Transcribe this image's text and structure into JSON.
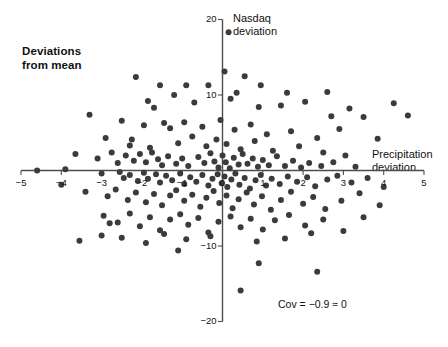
{
  "figure": {
    "title": "Deviations\nfrom mean",
    "width": 448,
    "height": 347,
    "background": "#ffffff",
    "point_color": "#3b3b3b",
    "axis_color": "#4d4d4d"
  },
  "annotations": {
    "covariance": "Cov = −0.9 ≈ 0"
  },
  "chart_data": {
    "type": "scatter",
    "title": "Deviations from mean",
    "xlabel": "Precipitation\ndeviation",
    "ylabel": "Nasdaq\ndeviation",
    "xlim": [
      -5,
      5
    ],
    "ylim": [
      -20,
      20
    ],
    "xticks": [
      -5,
      -4,
      -3,
      -2,
      -1,
      0,
      1,
      2,
      3,
      4,
      5
    ],
    "xticklabels": [
      "−5",
      "−4",
      "−3",
      "−2",
      "−1",
      "0",
      "1",
      "2",
      "3",
      "4",
      "5"
    ],
    "yticks": [
      -20,
      -10,
      0,
      10,
      20
    ],
    "yticklabels": [
      "−20",
      "−10",
      "0",
      "10",
      "20"
    ],
    "grid": false,
    "legend": null,
    "annotation": "Cov = −0.9 ≈ 0",
    "marker": {
      "shape": "circle",
      "size": 3.0,
      "color": "#3b3b3b"
    },
    "n_points": 200,
    "points": [
      [
        0.15,
        18.3
      ],
      [
        -2.15,
        12.4
      ],
      [
        -1.55,
        11.3
      ],
      [
        -0.9,
        11.3
      ],
      [
        -0.35,
        11.3
      ],
      [
        0.35,
        10.3
      ],
      [
        0.95,
        11.3
      ],
      [
        1.6,
        10.3
      ],
      [
        2.6,
        10.4
      ],
      [
        3.15,
        8.2
      ],
      [
        4.25,
        8.9
      ],
      [
        4.6,
        7.3
      ],
      [
        -1.85,
        9.2
      ],
      [
        -1.7,
        8.3
      ],
      [
        -1.2,
        10.0
      ],
      [
        -0.7,
        9.0
      ],
      [
        0.05,
        13.1
      ],
      [
        0.2,
        9.5
      ],
      [
        0.55,
        12.5
      ],
      [
        0.9,
        8.4
      ],
      [
        1.45,
        8.6
      ],
      [
        2.05,
        9.1
      ],
      [
        2.7,
        7.2
      ],
      [
        3.5,
        7.1
      ],
      [
        -3.3,
        7.4
      ],
      [
        -2.5,
        6.6
      ],
      [
        -1.95,
        6.0
      ],
      [
        -1.45,
        6.3
      ],
      [
        -1.3,
        5.6
      ],
      [
        -0.95,
        6.4
      ],
      [
        -0.5,
        5.8
      ],
      [
        -0.05,
        6.7
      ],
      [
        0.3,
        5.4
      ],
      [
        0.7,
        6.1
      ],
      [
        1.1,
        4.8
      ],
      [
        1.7,
        5.2
      ],
      [
        2.35,
        4.3
      ],
      [
        2.9,
        5.5
      ],
      [
        3.85,
        4.2
      ],
      [
        -2.9,
        4.3
      ],
      [
        -2.3,
        3.3
      ],
      [
        -2.25,
        4.1
      ],
      [
        -1.8,
        3.0
      ],
      [
        -1.1,
        3.6
      ],
      [
        -0.75,
        4.5
      ],
      [
        -0.4,
        3.2
      ],
      [
        -0.15,
        4.1
      ],
      [
        0.1,
        3.5
      ],
      [
        0.45,
        2.8
      ],
      [
        0.8,
        3.9
      ],
      [
        1.25,
        2.6
      ],
      [
        1.9,
        3.2
      ],
      [
        2.5,
        2.4
      ],
      [
        3.05,
        2.0
      ],
      [
        -3.65,
        2.2
      ],
      [
        -3.1,
        1.6
      ],
      [
        -2.75,
        2.4
      ],
      [
        -2.6,
        1.0
      ],
      [
        -2.4,
        2.0
      ],
      [
        -2.2,
        1.3
      ],
      [
        -2.05,
        2.2
      ],
      [
        -1.9,
        1.1
      ],
      [
        -1.75,
        2.4
      ],
      [
        -1.6,
        1.5
      ],
      [
        -1.5,
        0.7
      ],
      [
        -1.35,
        1.9
      ],
      [
        -1.15,
        0.9
      ],
      [
        -1.0,
        1.6
      ],
      [
        -0.85,
        0.6
      ],
      [
        -0.6,
        1.8
      ],
      [
        -0.45,
        1.0
      ],
      [
        -0.3,
        2.3
      ],
      [
        -0.2,
        1.2
      ],
      [
        -0.1,
        0.4
      ],
      [
        0.0,
        2.0
      ],
      [
        0.08,
        1.1
      ],
      [
        0.18,
        0.3
      ],
      [
        0.28,
        1.7
      ],
      [
        0.4,
        0.8
      ],
      [
        0.5,
        2.2
      ],
      [
        0.62,
        0.9
      ],
      [
        0.75,
        1.6
      ],
      [
        0.88,
        0.5
      ],
      [
        1.0,
        1.4
      ],
      [
        1.15,
        0.7
      ],
      [
        1.35,
        1.9
      ],
      [
        1.55,
        0.6
      ],
      [
        1.75,
        1.3
      ],
      [
        1.95,
        0.4
      ],
      [
        2.15,
        1.0
      ],
      [
        2.45,
        0.6
      ],
      [
        2.75,
        1.1
      ],
      [
        3.3,
        0.5
      ],
      [
        -4.6,
        0.0
      ],
      [
        -3.9,
        0.15
      ],
      [
        -3.0,
        -0.4
      ],
      [
        -2.55,
        -0.2
      ],
      [
        -2.45,
        -1.0
      ],
      [
        -2.3,
        -0.6
      ],
      [
        -2.1,
        -1.4
      ],
      [
        -1.95,
        -0.3
      ],
      [
        -1.85,
        -1.1
      ],
      [
        -1.65,
        -0.5
      ],
      [
        -1.55,
        -1.6
      ],
      [
        -1.4,
        -0.7
      ],
      [
        -1.25,
        -1.3
      ],
      [
        -1.05,
        -0.4
      ],
      [
        -0.95,
        -1.8
      ],
      [
        -0.8,
        -0.9
      ],
      [
        -0.65,
        -1.5
      ],
      [
        -0.5,
        -0.6
      ],
      [
        -0.35,
        -2.0
      ],
      [
        -0.25,
        -1.1
      ],
      [
        -0.12,
        -0.5
      ],
      [
        -0.02,
        -1.7
      ],
      [
        0.05,
        -0.8
      ],
      [
        0.12,
        -2.2
      ],
      [
        0.22,
        -1.2
      ],
      [
        0.32,
        -0.4
      ],
      [
        0.42,
        -1.9
      ],
      [
        0.55,
        -1.0
      ],
      [
        0.68,
        -2.4
      ],
      [
        0.82,
        -1.3
      ],
      [
        0.95,
        -0.6
      ],
      [
        1.08,
        -2.0
      ],
      [
        1.22,
        -1.1
      ],
      [
        1.42,
        -1.8
      ],
      [
        1.62,
        -0.8
      ],
      [
        1.85,
        -1.5
      ],
      [
        2.1,
        -0.9
      ],
      [
        2.3,
        -2.1
      ],
      [
        2.6,
        -1.2
      ],
      [
        2.85,
        -0.7
      ],
      [
        3.2,
        -1.6
      ],
      [
        3.6,
        -1.0
      ],
      [
        4.0,
        -2.2
      ],
      [
        -3.4,
        -2.8
      ],
      [
        -2.85,
        -3.4
      ],
      [
        -2.65,
        -2.5
      ],
      [
        -2.35,
        -3.9
      ],
      [
        -2.15,
        -2.9
      ],
      [
        -1.9,
        -4.2
      ],
      [
        -1.7,
        -3.1
      ],
      [
        -1.5,
        -4.6
      ],
      [
        -1.3,
        -3.3
      ],
      [
        -1.15,
        -2.6
      ],
      [
        -0.95,
        -4.0
      ],
      [
        -0.75,
        -3.2
      ],
      [
        -0.55,
        -4.8
      ],
      [
        -0.4,
        -3.6
      ],
      [
        -0.22,
        -2.7
      ],
      [
        -0.08,
        -4.3
      ],
      [
        0.1,
        -3.3
      ],
      [
        0.25,
        -5.0
      ],
      [
        0.4,
        -3.8
      ],
      [
        0.6,
        -2.9
      ],
      [
        0.78,
        -4.5
      ],
      [
        0.98,
        -3.4
      ],
      [
        1.2,
        -5.2
      ],
      [
        1.45,
        -3.9
      ],
      [
        1.7,
        -2.8
      ],
      [
        2.0,
        -4.4
      ],
      [
        2.25,
        -3.5
      ],
      [
        2.55,
        -5.1
      ],
      [
        2.95,
        -4.0
      ],
      [
        3.4,
        -3.0
      ],
      [
        3.9,
        -4.6
      ],
      [
        -2.95,
        -6.0
      ],
      [
        -2.6,
        -6.9
      ],
      [
        -2.3,
        -5.7
      ],
      [
        -2.05,
        -7.4
      ],
      [
        -1.8,
        -6.2
      ],
      [
        -1.55,
        -7.9
      ],
      [
        -1.3,
        -6.5
      ],
      [
        -1.05,
        -5.8
      ],
      [
        -0.85,
        -7.2
      ],
      [
        -0.6,
        -6.3
      ],
      [
        -0.35,
        -8.2
      ],
      [
        -0.1,
        -6.8
      ],
      [
        0.2,
        -6.1
      ],
      [
        0.45,
        -7.5
      ],
      [
        0.7,
        -6.4
      ],
      [
        1.0,
        -7.8
      ],
      [
        1.3,
        -6.6
      ],
      [
        1.65,
        -5.9
      ],
      [
        2.05,
        -7.3
      ],
      [
        2.5,
        -6.5
      ],
      [
        3.0,
        -8.0
      ],
      [
        3.5,
        -6.2
      ],
      [
        -3.55,
        -9.3
      ],
      [
        -3.0,
        -8.6
      ],
      [
        -2.5,
        -8.9
      ],
      [
        -1.9,
        -9.6
      ],
      [
        -1.45,
        -8.4
      ],
      [
        -0.9,
        -9.1
      ],
      [
        0.85,
        -9.4
      ],
      [
        0.9,
        -12.3
      ],
      [
        0.45,
        -15.9
      ],
      [
        2.35,
        -13.4
      ],
      [
        -1.1,
        -10.6
      ],
      [
        -0.3,
        -8.7
      ],
      [
        1.55,
        -9.0
      ],
      [
        2.2,
        -8.3
      ],
      [
        -2.8,
        -7.0
      ],
      [
        -4.0,
        -1.9
      ]
    ]
  }
}
